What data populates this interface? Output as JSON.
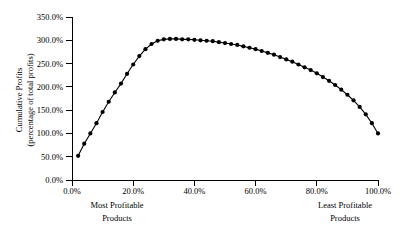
{
  "chart_data": {
    "type": "line",
    "title": "",
    "subtitle": "",
    "xlabel": "",
    "ylabel": "Cumulative Profits (percentage of total profits)",
    "ylabel_line1": "Cumulative Profits",
    "ylabel_line2": "(percentage of total profits)",
    "xlim": [
      0,
      100
    ],
    "ylim": [
      0,
      350
    ],
    "grid": false,
    "legend": false,
    "legend_position": "none",
    "marker": "filled-circle",
    "marker_color": "#000000",
    "line_color": "#000000",
    "xtick_labels": [
      "0.0%",
      "20.0%",
      "40.0%",
      "60.0%",
      "80.0%",
      "100.0%"
    ],
    "xtick_values": [
      0,
      20,
      40,
      60,
      80,
      100
    ],
    "ytick_labels": [
      "0.0%",
      "50.0%",
      "100.0%",
      "150.0%",
      "200.0%",
      "250.0%",
      "300.0%",
      "350.0%"
    ],
    "ytick_values": [
      0,
      50,
      100,
      150,
      200,
      250,
      300,
      350
    ],
    "x_axis_caption_left_line1": "Most Profitable",
    "x_axis_caption_left_line2": "Products",
    "x_axis_caption_right_line1": "Least Profitable",
    "x_axis_caption_right_line2": "Products",
    "series": [
      {
        "name": "Cumulative Profits",
        "x": [
          2,
          4,
          6,
          8,
          10,
          12,
          14,
          16,
          18,
          20,
          22,
          24,
          26,
          28,
          30,
          32,
          34,
          36,
          38,
          40,
          42,
          44,
          46,
          48,
          50,
          52,
          54,
          56,
          58,
          60,
          62,
          64,
          66,
          68,
          70,
          72,
          74,
          76,
          78,
          80,
          82,
          84,
          86,
          88,
          90,
          92,
          94,
          96,
          98,
          100
        ],
        "values": [
          52,
          78,
          100,
          122,
          146,
          168,
          188,
          207,
          228,
          248,
          266,
          281,
          292,
          299,
          302,
          303,
          303,
          302,
          302,
          301,
          300,
          299,
          298,
          296,
          294,
          292,
          290,
          287,
          284,
          281,
          277,
          273,
          269,
          264,
          259,
          254,
          248,
          242,
          236,
          229,
          221,
          213,
          204,
          194,
          183,
          171,
          157,
          141,
          122,
          100
        ]
      }
    ]
  }
}
